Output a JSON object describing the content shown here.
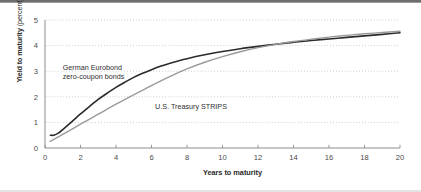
{
  "figure": {
    "name": "yield-curve-comparison",
    "background": "#ffffff",
    "top_rule_color": "#6e6e6e",
    "bottom_rule_color": "#e3e3e3"
  },
  "chart_data": {
    "type": "line",
    "title": "",
    "xlabel": "Years to maturity",
    "ylabel_bold": "Yield to maturity",
    "ylabel_light": "(percent)",
    "xlim": [
      0,
      20
    ],
    "ylim": [
      0,
      5
    ],
    "xticks": [
      0,
      2,
      4,
      6,
      8,
      10,
      12,
      14,
      16,
      18,
      20
    ],
    "xtick_labels": [
      "0",
      "2",
      "4",
      "6",
      "8",
      "10",
      "12",
      "14",
      "16",
      "18",
      "20"
    ],
    "yticks": [
      0,
      1,
      2,
      3,
      4,
      5
    ],
    "ytick_labels": [
      "0",
      "1",
      "2",
      "3",
      "4",
      "5"
    ],
    "grid": "horizontal-dotted",
    "legend": "inline-annotations",
    "series": [
      {
        "name": "German Eurobond zero-coupon bonds",
        "color": "#2b2b2b",
        "width": 1.6,
        "label_line_1": "German Eurobond",
        "label_line_2": "zero-coupon bonds",
        "x": [
          0.3,
          0.5,
          0.75,
          1.0,
          1.5,
          2.0,
          2.5,
          3.0,
          3.5,
          4.0,
          4.5,
          5.0,
          5.5,
          6.0,
          6.5,
          7.0,
          7.5,
          8.0,
          9.0,
          10.0,
          11.0,
          12.0,
          13.0,
          14.0,
          15.0,
          16.0,
          17.0,
          18.0,
          19.0,
          20.0
        ],
        "y": [
          0.5,
          0.5,
          0.58,
          0.72,
          1.02,
          1.33,
          1.62,
          1.9,
          2.14,
          2.37,
          2.57,
          2.76,
          2.92,
          3.06,
          3.19,
          3.3,
          3.4,
          3.49,
          3.64,
          3.77,
          3.88,
          3.97,
          4.05,
          4.13,
          4.2,
          4.26,
          4.32,
          4.38,
          4.44,
          4.5
        ]
      },
      {
        "name": "U.S. Treasury STRIPS",
        "color": "#9a9a9a",
        "width": 1.4,
        "label": "U.S. Treasury STRIPS",
        "x": [
          0.3,
          1.0,
          2.0,
          3.0,
          4.0,
          5.0,
          6.0,
          7.0,
          8.0,
          9.0,
          10.0,
          11.0,
          12.0,
          13.0,
          14.0,
          15.0,
          16.0,
          17.0,
          18.0,
          19.0,
          20.0
        ],
        "y": [
          0.26,
          0.53,
          0.93,
          1.32,
          1.71,
          2.08,
          2.44,
          2.78,
          3.09,
          3.35,
          3.57,
          3.76,
          3.92,
          4.05,
          4.16,
          4.25,
          4.33,
          4.4,
          4.46,
          4.51,
          4.56
        ]
      }
    ],
    "annotations": [
      {
        "text": "German Eurobond",
        "x": 1.0,
        "y": 3.05
      },
      {
        "text": "zero-coupon bonds",
        "x": 1.0,
        "y": 2.7
      },
      {
        "text": "U.S. Treasury STRIPS",
        "x": 6.2,
        "y": 1.52
      }
    ]
  }
}
